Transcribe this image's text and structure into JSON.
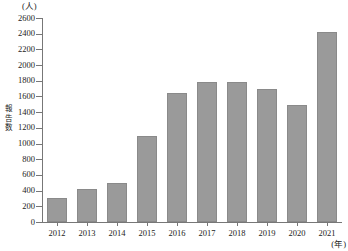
{
  "chart_data": {
    "type": "bar",
    "title": "",
    "subtitle": "",
    "xlabel": "(年)",
    "ylabel": "報告数",
    "ylabel_chars": [
      "報",
      "告",
      "数"
    ],
    "yunit": "(人)",
    "categories": [
      "2012",
      "2013",
      "2014",
      "2015",
      "2016",
      "2017",
      "2018",
      "2019",
      "2020",
      "2021"
    ],
    "values": [
      300,
      420,
      500,
      1100,
      1650,
      1790,
      1780,
      1700,
      1490,
      2420
    ],
    "ylim": [
      0,
      2600
    ],
    "ytick_step": 200,
    "yticks": [
      0,
      200,
      400,
      600,
      800,
      1000,
      1200,
      1400,
      1600,
      1800,
      2000,
      2200,
      2400,
      2600
    ],
    "ytick_labels": [
      "0",
      "200",
      "400",
      "600",
      "800",
      "1000",
      "1200",
      "1400",
      "1600",
      "1800",
      "2000",
      "2200",
      "2400",
      "2600"
    ],
    "grid": false,
    "legend": null,
    "legend_position": "none",
    "bar_color": "#9a9a9a",
    "axis_color": "#777777",
    "text_color": "#222222"
  }
}
